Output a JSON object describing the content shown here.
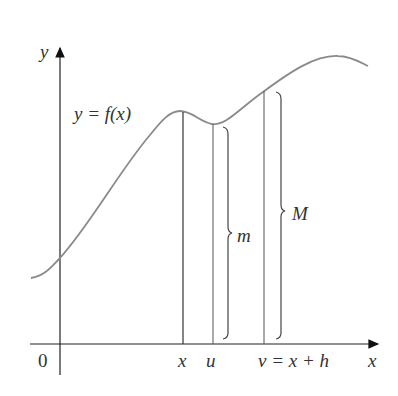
{
  "figure": {
    "type": "mean-value-integral-diagram",
    "axes": {
      "x_label": "x",
      "y_label": "y",
      "origin_label": "0"
    },
    "curve_label": "y = f(x)",
    "x_markers": [
      "x",
      "u",
      "v = x + h"
    ],
    "brackets": {
      "min_label": "m",
      "max_label": "M"
    },
    "colors": {
      "curve": "#8a8a8a",
      "lines": "#333333",
      "axes": "#222222"
    }
  }
}
